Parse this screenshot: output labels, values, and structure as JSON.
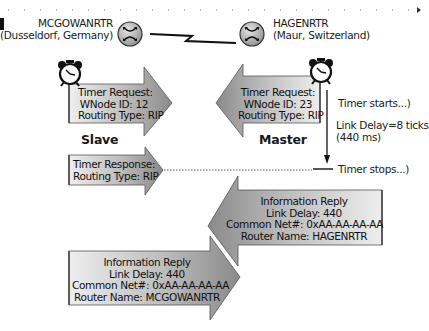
{
  "routers": {
    "left": {
      "name": "MCGOWANRTR",
      "location": "(Dusseldorf, Germany)",
      "icon": "router-icon"
    },
    "right": {
      "name": "HAGENRTR",
      "location": "(Maur, Switzerland)",
      "icon": "router-icon"
    }
  },
  "link": {
    "icon": "serial-link-lightning-icon"
  },
  "roles": {
    "left": "Slave",
    "right": "Master"
  },
  "messages": {
    "slave_timer_request": [
      "Timer Request:",
      "WNode ID: 12",
      "Routing Type: RIP"
    ],
    "master_timer_request": [
      "Timer Request:",
      "WNode ID: 23",
      "Routing Type: RIP"
    ],
    "timer_response": [
      "Timer Response:",
      "Routing Type: RIP"
    ],
    "info_reply_hagen": [
      "Information Reply",
      "Link Delay: 440",
      "Common Net#: 0xAA-AA-AA-AA",
      "Router Name: HAGENRTR"
    ],
    "info_reply_mcgowan": [
      "Information Reply",
      "Link Delay: 440",
      "Common Net#: 0xAA-AA-AA-AA",
      "Router Name: MCGOWANRTR"
    ]
  },
  "timer": {
    "start_label": "Timer starts...)",
    "delay_label": "Link Delay=8 ticks",
    "delay_ms": "(440 ms)",
    "stop_label": "Timer stops...)",
    "icon": "alarm-clock-icon"
  },
  "colors": {
    "arrow_fill_dark": "#8c8c8c",
    "arrow_fill_light": "#e6e6e6",
    "line": "#111111"
  }
}
